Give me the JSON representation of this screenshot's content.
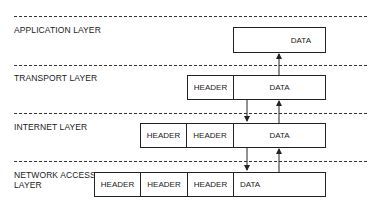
{
  "layers": [
    {
      "name": "application",
      "label": "APPLICATION LAYER"
    },
    {
      "name": "transport",
      "label": "TRANSPORT LAYER"
    },
    {
      "name": "internet",
      "label": "INTERNET LAYER"
    },
    {
      "name": "network-access",
      "label": "NETWORK ACCESS\nLAYER"
    }
  ],
  "packets": {
    "application": {
      "data": "DATA"
    },
    "transport": {
      "headers": [
        "HEADER"
      ],
      "data": "DATA"
    },
    "internet": {
      "headers": [
        "HEADER",
        "HEADER"
      ],
      "data": "DATA"
    },
    "network_access": {
      "headers": [
        "HEADER",
        "HEADER",
        "HEADER"
      ],
      "data": "DATA"
    }
  },
  "colors": {
    "line": "#222222",
    "background": "#ffffff"
  }
}
